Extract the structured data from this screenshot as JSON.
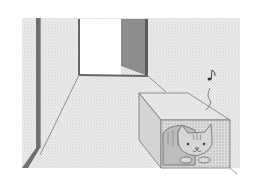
{
  "illustration": {
    "subject": "cat hiding inside a cardboard box in a hallway",
    "elements": [
      "hallway",
      "open-door",
      "dark-door-panel",
      "box",
      "cat",
      "music-note"
    ],
    "palette": {
      "background": "#ffffff",
      "dotted-fill": "#e4e4e4",
      "wall-edge": "#6e6e6e",
      "door-panel": "#8a8a8a",
      "line": "#777777",
      "box-fill": "#d8d8d8"
    },
    "music_note_glyph": "♪"
  }
}
